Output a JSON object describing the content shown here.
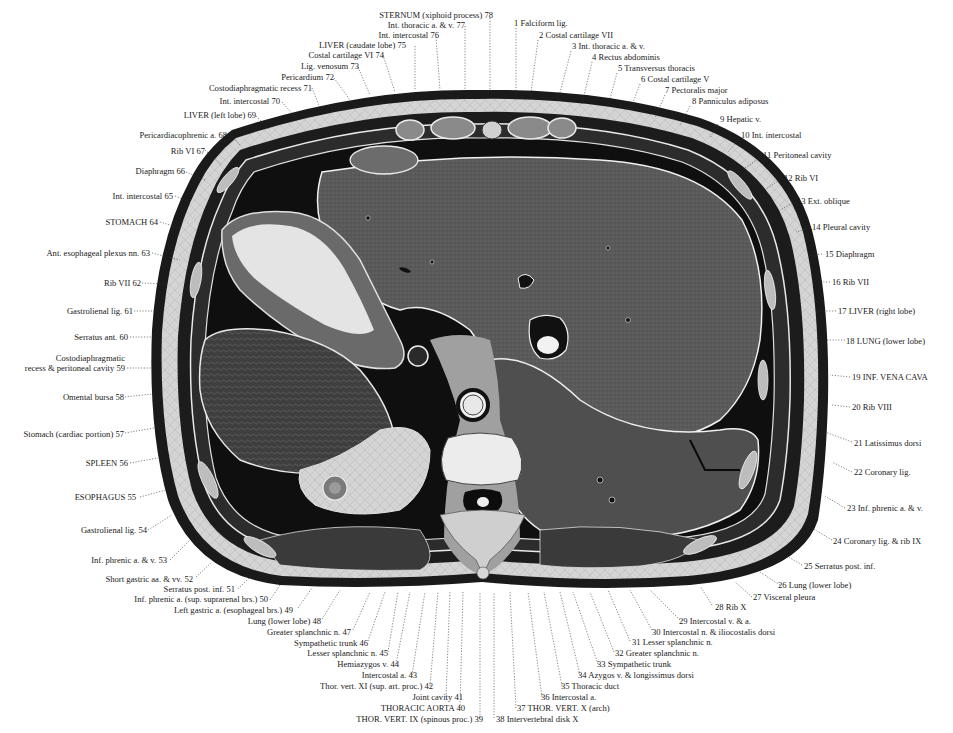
{
  "figure": {
    "type": "anatomical-cross-section",
    "colors": {
      "background": "#ffffff",
      "skin": "#1a1a1a",
      "fat": "#c8c8c8",
      "muscle": "#555555",
      "liver": "#5e5e5e",
      "spleen": "#4a4a4a",
      "stomach_contents": "#dedede",
      "vertebra": "#e8e8e8",
      "cavity": "#0d0d0d",
      "label_text": "#1a1a1a"
    }
  },
  "labels_right": [
    {
      "num": "1",
      "text": "Falciform lig."
    },
    {
      "num": "2",
      "text": "Costal cartilage VII"
    },
    {
      "num": "3",
      "text": "Int. thoracic a. & v."
    },
    {
      "num": "4",
      "text": "Rectus abdominis"
    },
    {
      "num": "5",
      "text": "Transversus thoracis"
    },
    {
      "num": "6",
      "text": "Costal cartilage V"
    },
    {
      "num": "7",
      "text": "Pectoralis major"
    },
    {
      "num": "8",
      "text": "Panniculus adiposus"
    },
    {
      "num": "9",
      "text": "Hepatic v."
    },
    {
      "num": "10",
      "text": "Int. intercostal"
    },
    {
      "num": "11",
      "text": "Peritoneal cavity"
    },
    {
      "num": "12",
      "text": "Rib VI"
    },
    {
      "num": "13",
      "text": "Ext. oblique"
    },
    {
      "num": "14",
      "text": "Pleural cavity"
    },
    {
      "num": "15",
      "text": "Diaphragm"
    },
    {
      "num": "16",
      "text": "Rib VII"
    },
    {
      "num": "17",
      "text": "LIVER (right lobe)"
    },
    {
      "num": "18",
      "text": "LUNG (lower lobe)"
    },
    {
      "num": "19",
      "text": "INF. VENA CAVA"
    },
    {
      "num": "20",
      "text": "Rib VIII"
    },
    {
      "num": "21",
      "text": "Latissimus dorsi"
    },
    {
      "num": "22",
      "text": "Coronary lig."
    },
    {
      "num": "23",
      "text": "Inf. phrenic a. & v."
    },
    {
      "num": "24",
      "text": "Coronary lig. & rib IX"
    },
    {
      "num": "25",
      "text": "Serratus post. inf."
    },
    {
      "num": "26",
      "text": "Lung (lower lobe)"
    },
    {
      "num": "27",
      "text": "Visceral pleura"
    },
    {
      "num": "28",
      "text": "Rib X"
    },
    {
      "num": "29",
      "text": "Intercostal v. & a."
    },
    {
      "num": "30",
      "text": "Intercostal n. & iliocostalis dorsi"
    },
    {
      "num": "31",
      "text": "Lesser splanchnic n."
    },
    {
      "num": "32",
      "text": "Greater splanchnic n."
    },
    {
      "num": "33",
      "text": "Sympathetic trunk"
    },
    {
      "num": "34",
      "text": "Azygos v. & longissimus dorsi"
    },
    {
      "num": "35",
      "text": "Thoracic duct"
    },
    {
      "num": "36",
      "text": "Intercostal a."
    },
    {
      "num": "37",
      "text": "THOR. VERT. X (arch)"
    },
    {
      "num": "38",
      "text": "Intervertebral disk X"
    }
  ],
  "labels_left": [
    {
      "num": "39",
      "text": "THOR. VERT. IX (spinous proc.)"
    },
    {
      "num": "40",
      "text": "THORACIC AORTA"
    },
    {
      "num": "41",
      "text": "Joint cavity"
    },
    {
      "num": "42",
      "text": "Thor. vert. XI (sup. art. proc.)"
    },
    {
      "num": "43",
      "text": "Intercostal a."
    },
    {
      "num": "44",
      "text": "Hemiazygos v."
    },
    {
      "num": "45",
      "text": "Lesser splanchnic n."
    },
    {
      "num": "46",
      "text": "Sympathetic trunk"
    },
    {
      "num": "47",
      "text": "Greater splanchnic n."
    },
    {
      "num": "48",
      "text": "Lung (lower lobe)"
    },
    {
      "num": "49",
      "text": "Left gastric a. (esophageal brs.)"
    },
    {
      "num": "50",
      "text": "Inf. phrenic a. (sup. suprarenal brs.)"
    },
    {
      "num": "51",
      "text": "Serratus post. inf."
    },
    {
      "num": "52",
      "text": "Short gastric aa. & vv."
    },
    {
      "num": "53",
      "text": "Inf. phrenic a. & v."
    },
    {
      "num": "54",
      "text": "Gastrolienal lig."
    },
    {
      "num": "55",
      "text": "ESOPHAGUS"
    },
    {
      "num": "56",
      "text": "SPLEEN"
    },
    {
      "num": "57",
      "text": "Stomach (cardiac portion)"
    },
    {
      "num": "58",
      "text": "Omental bursa"
    },
    {
      "num": "59",
      "text": "Costodiaphragmatic\nrecess & peritoneal cavity"
    },
    {
      "num": "60",
      "text": "Serratus ant."
    },
    {
      "num": "61",
      "text": "Gastrolienal lig."
    },
    {
      "num": "62",
      "text": "Rib VII"
    },
    {
      "num": "63",
      "text": "Ant. esophageal plexus nn."
    },
    {
      "num": "64",
      "text": "STOMACH"
    },
    {
      "num": "65",
      "text": "Int. intercostal"
    },
    {
      "num": "66",
      "text": "Diaphragm"
    },
    {
      "num": "67",
      "text": "Rib VI"
    },
    {
      "num": "68",
      "text": "Pericardiacophrenic a."
    },
    {
      "num": "69",
      "text": "LIVER (left lobe)"
    },
    {
      "num": "70",
      "text": "Int. intercostal"
    },
    {
      "num": "71",
      "text": "Costodiaphragmatic recess"
    },
    {
      "num": "72",
      "text": "Pericardium"
    },
    {
      "num": "73",
      "text": "Lig. venosum"
    },
    {
      "num": "74",
      "text": "Costal cartilage VI"
    },
    {
      "num": "75",
      "text": "LIVER (caudate lobe)"
    },
    {
      "num": "76",
      "text": "Int. intercostal"
    },
    {
      "num": "77",
      "text": "Int. thoracic a. & v."
    },
    {
      "num": "78",
      "text": "STERNUM (xiphoid process)"
    }
  ]
}
